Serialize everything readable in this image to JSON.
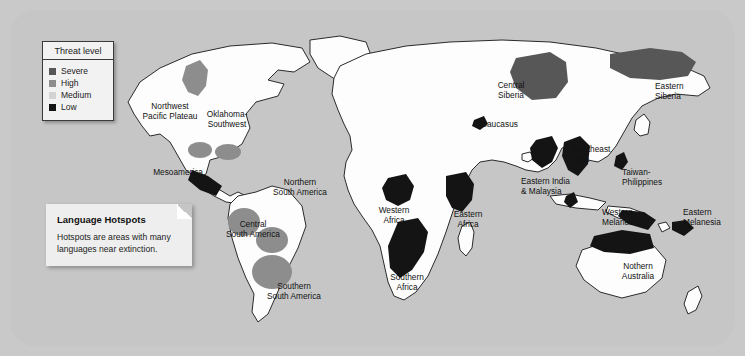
{
  "map": {
    "title": "Language Hotspots map",
    "colors": {
      "page_background": "#c9c9c9",
      "ocean": "#c6c6c6",
      "land": "#fdfdfd",
      "coastline": "#2a2a2a",
      "severe": "#575757",
      "high": "#8d8d8d",
      "medium": "#d3d3d3",
      "low": "#141414"
    }
  },
  "legend": {
    "title": "Threat level",
    "items": [
      {
        "label": "Severe",
        "color": "#575757"
      },
      {
        "label": "High",
        "color": "#8d8d8d"
      },
      {
        "label": "Medium",
        "color": "#d3d3d3"
      },
      {
        "label": "Low",
        "color": "#141414"
      }
    ]
  },
  "caption": {
    "title": "Language Hotspots",
    "text": "Hotspots are areas with many languages near extinction."
  },
  "hotspots": [
    {
      "name": "Northwest Pacific Plateau",
      "label": "Northwest\nPacific Plateau",
      "threat": "High",
      "color": "#8d8d8d",
      "align": "center",
      "x": 124,
      "y": 92,
      "w": 72
    },
    {
      "name": "Oklahoma-Southwest",
      "label": "Oklahoma-\nSouthwest",
      "threat": "High",
      "color": "#8d8d8d",
      "align": "center",
      "x": 186,
      "y": 100,
      "w": 62
    },
    {
      "name": "Mesoamerica",
      "label": "Mesoamerica",
      "threat": "Low",
      "color": "#141414",
      "align": "right",
      "x": 131,
      "y": 158,
      "w": 62
    },
    {
      "name": "Northern South America",
      "label": "Northern\nSouth America",
      "threat": "High",
      "color": "#8d8d8d",
      "align": "center",
      "x": 258,
      "y": 168,
      "w": 64
    },
    {
      "name": "Central South America",
      "label": "Central\nSouth America",
      "threat": "High",
      "color": "#8d8d8d",
      "align": "center",
      "x": 211,
      "y": 210,
      "w": 64
    },
    {
      "name": "Southern South America",
      "label": "Southern\nSouth America",
      "threat": "High",
      "color": "#8d8d8d",
      "align": "center",
      "x": 251,
      "y": 272,
      "w": 66
    },
    {
      "name": "Western Africa",
      "label": "Western\nAfrica",
      "threat": "Low",
      "color": "#141414",
      "align": "center",
      "x": 360,
      "y": 196,
      "w": 48
    },
    {
      "name": "Eastern Africa",
      "label": "Eastern\nAfrica",
      "threat": "Low",
      "color": "#141414",
      "align": "center",
      "x": 434,
      "y": 200,
      "w": 48
    },
    {
      "name": "Southern Africa",
      "label": "Southern\nAfrica",
      "threat": "Low",
      "color": "#141414",
      "align": "center",
      "x": 372,
      "y": 263,
      "w": 50
    },
    {
      "name": "Central Siberia",
      "label": "Central\nSiberia",
      "threat": "Severe",
      "color": "#575757",
      "align": "center",
      "x": 478,
      "y": 71,
      "w": 46
    },
    {
      "name": "Caucasus",
      "label": "Caucasus",
      "threat": "Low",
      "color": "#141414",
      "align": "left",
      "x": 471,
      "y": 110,
      "w": 50
    },
    {
      "name": "Eastern Siberia",
      "label": "Eastern\nSiberia",
      "threat": "Severe",
      "color": "#575757",
      "align": "left",
      "x": 645,
      "y": 72,
      "w": 46
    },
    {
      "name": "Southeast Asia",
      "label": "Southeast\nAsia",
      "threat": "Low",
      "color": "#141414",
      "align": "left",
      "x": 563,
      "y": 135,
      "w": 54
    },
    {
      "name": "Eastern India & Malaysia",
      "label": "Eastern India\n& Malaysia",
      "threat": "Low",
      "color": "#141414",
      "align": "left",
      "x": 511,
      "y": 167,
      "w": 62
    },
    {
      "name": "Taiwan-Philippines",
      "label": "Taiwan-\nPhilippines",
      "threat": "Low",
      "color": "#141414",
      "align": "left",
      "x": 612,
      "y": 158,
      "w": 56
    },
    {
      "name": "Western Melanesia",
      "label": "Western\nMelanesia",
      "threat": "Low",
      "color": "#141414",
      "align": "left",
      "x": 592,
      "y": 198,
      "w": 54
    },
    {
      "name": "Eastern Melanesia",
      "label": "Eastern\nMelanesia",
      "threat": "Low",
      "color": "#141414",
      "align": "left",
      "x": 673,
      "y": 198,
      "w": 54
    },
    {
      "name": "Nothern Australia",
      "label": "Nothern\nAustralia",
      "threat": "Low",
      "color": "#141414",
      "align": "center",
      "x": 600,
      "y": 252,
      "w": 56
    }
  ]
}
